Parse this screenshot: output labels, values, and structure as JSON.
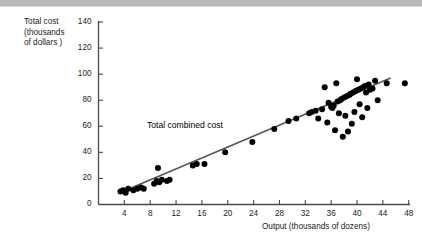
{
  "figure": {
    "y_axis_title": "Total cost\n(thousands\nof dollars )",
    "x_axis_title": "Output (thousands of dozens)",
    "annotation_label": "Total combined cost",
    "top_bar_color": "#b9b9b9",
    "axis_color": "#4a4a4a",
    "point_color": "#000000",
    "line_color": "#555555",
    "text_color": "#1b1b1b"
  },
  "chart_data": {
    "type": "scatter",
    "title": "",
    "subtitle": "",
    "xlabel": "Output (thousands of dozens)",
    "ylabel": "Total cost (thousands of dollars )",
    "xlim": [
      0,
      48.2
    ],
    "ylim": [
      0,
      140
    ],
    "xticks": [
      4,
      8,
      12,
      16,
      20,
      24,
      28,
      32,
      36,
      40,
      44,
      48
    ],
    "yticks": [
      0,
      20,
      40,
      60,
      80,
      100,
      120,
      140
    ],
    "xtick_labels": [
      "4",
      "8",
      "12",
      "16",
      "20",
      "24",
      "28",
      "32",
      "36",
      "40",
      "44",
      "48"
    ],
    "ytick_labels": [
      "0",
      "20",
      "40",
      "60",
      "80",
      "100",
      "120",
      "140"
    ],
    "grid": false,
    "legend": false,
    "annotations": [
      {
        "text": "Total combined cost",
        "x": 15.5,
        "y": 55
      }
    ],
    "series": [
      {
        "name": "Total combined cost",
        "type": "scatter",
        "marker": "circle",
        "color": "#000000",
        "points": [
          [
            3.4,
            10
          ],
          [
            3.8,
            11
          ],
          [
            4.2,
            9
          ],
          [
            4.6,
            12
          ],
          [
            5.4,
            11
          ],
          [
            6.0,
            12
          ],
          [
            6.6,
            13
          ],
          [
            7.0,
            12
          ],
          [
            8.6,
            16
          ],
          [
            9.0,
            18
          ],
          [
            9.4,
            17
          ],
          [
            9.8,
            19
          ],
          [
            9.2,
            28
          ],
          [
            10.6,
            18
          ],
          [
            11.0,
            19
          ],
          [
            14.6,
            30
          ],
          [
            15.2,
            31
          ],
          [
            16.4,
            31
          ],
          [
            19.6,
            40
          ],
          [
            23.8,
            48
          ],
          [
            27.2,
            58
          ],
          [
            29.4,
            64
          ],
          [
            30.6,
            66
          ],
          [
            32.6,
            70
          ],
          [
            33.0,
            71
          ],
          [
            33.6,
            72
          ],
          [
            34.0,
            66
          ],
          [
            34.6,
            73
          ],
          [
            35.0,
            90
          ],
          [
            35.4,
            63
          ],
          [
            35.6,
            78
          ],
          [
            36.0,
            75
          ],
          [
            36.2,
            74
          ],
          [
            36.4,
            76
          ],
          [
            36.6,
            57
          ],
          [
            36.8,
            93
          ],
          [
            37.0,
            79
          ],
          [
            37.2,
            70
          ],
          [
            37.4,
            80
          ],
          [
            37.6,
            81
          ],
          [
            37.8,
            52
          ],
          [
            38.0,
            82
          ],
          [
            38.2,
            68
          ],
          [
            38.4,
            83
          ],
          [
            38.6,
            56
          ],
          [
            38.8,
            84
          ],
          [
            39.0,
            85
          ],
          [
            39.2,
            62
          ],
          [
            39.4,
            86
          ],
          [
            39.6,
            71
          ],
          [
            39.8,
            87
          ],
          [
            40.0,
            96
          ],
          [
            40.2,
            88
          ],
          [
            40.4,
            77
          ],
          [
            40.6,
            89
          ],
          [
            40.8,
            67
          ],
          [
            41.0,
            90
          ],
          [
            41.2,
            91
          ],
          [
            41.4,
            86
          ],
          [
            41.6,
            74
          ],
          [
            41.8,
            92
          ],
          [
            42.0,
            88
          ],
          [
            42.4,
            89
          ],
          [
            42.8,
            95
          ],
          [
            43.2,
            80
          ],
          [
            44.6,
            93
          ],
          [
            47.4,
            93
          ]
        ]
      },
      {
        "name": "regression-line",
        "type": "line",
        "color": "#555555",
        "points": [
          [
            3.3,
            9
          ],
          [
            45.2,
            97
          ]
        ]
      }
    ]
  }
}
